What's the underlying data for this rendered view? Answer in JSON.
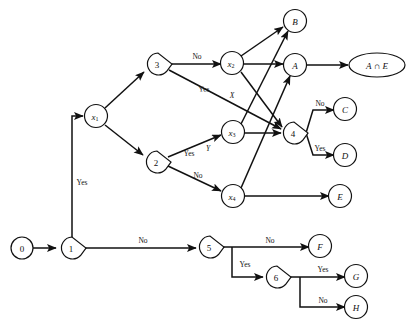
{
  "diagram": {
    "canvas": {
      "width": 411,
      "height": 326
    },
    "colors": {
      "stroke": "#111111",
      "fill": "#ffffff",
      "background": "#ffffff"
    },
    "nodes": [
      {
        "id": "n0",
        "label": "0",
        "shape": "circle",
        "x": 22,
        "y": 248
      },
      {
        "id": "n1",
        "label": "1",
        "shape": "teardrop",
        "x": 72,
        "y": 248
      },
      {
        "id": "nx1",
        "label": "x",
        "sub": "1",
        "shape": "circle",
        "x": 96,
        "y": 116,
        "italic": true
      },
      {
        "id": "n3",
        "label": "3",
        "shape": "teardrop",
        "x": 158,
        "y": 64
      },
      {
        "id": "n2",
        "label": "2",
        "shape": "teardrop",
        "x": 157,
        "y": 162
      },
      {
        "id": "nx2",
        "label": "x",
        "sub": "2",
        "shape": "circle",
        "x": 232,
        "y": 63,
        "italic": true
      },
      {
        "id": "nx3",
        "label": "x",
        "sub": "3",
        "shape": "circle",
        "x": 233,
        "y": 132,
        "italic": true
      },
      {
        "id": "nx4",
        "label": "x",
        "sub": "4",
        "shape": "circle",
        "x": 233,
        "y": 196,
        "italic": true
      },
      {
        "id": "nB",
        "label": "B",
        "shape": "circle",
        "x": 295,
        "y": 21,
        "italic": true
      },
      {
        "id": "nA",
        "label": "A",
        "shape": "circle",
        "x": 295,
        "y": 65,
        "italic": true
      },
      {
        "id": "n4",
        "label": "4",
        "shape": "teardrop",
        "x": 294,
        "y": 133
      },
      {
        "id": "nAE",
        "label": "A ∩ E",
        "shape": "ellipse",
        "x": 377,
        "y": 65,
        "italic": true
      },
      {
        "id": "nC",
        "label": "C",
        "shape": "circle",
        "x": 345,
        "y": 109,
        "italic": true
      },
      {
        "id": "nD",
        "label": "D",
        "shape": "circle",
        "x": 345,
        "y": 155,
        "italic": true
      },
      {
        "id": "nE",
        "label": "E",
        "shape": "circle",
        "x": 340,
        "y": 196,
        "italic": true
      },
      {
        "id": "n5",
        "label": "5",
        "shape": "teardrop",
        "x": 210,
        "y": 247
      },
      {
        "id": "n6",
        "label": "6",
        "shape": "teardrop",
        "x": 277,
        "y": 277
      },
      {
        "id": "nF",
        "label": "F",
        "shape": "circle",
        "x": 320,
        "y": 246,
        "italic": true
      },
      {
        "id": "nG",
        "label": "G",
        "shape": "circle",
        "x": 356,
        "y": 276,
        "italic": true
      },
      {
        "id": "nH",
        "label": "H",
        "shape": "circle",
        "x": 356,
        "y": 307,
        "italic": true
      }
    ],
    "edges": [
      {
        "id": "e0_1",
        "from": "n0",
        "to": "n1",
        "label": ""
      },
      {
        "id": "e1_x1",
        "from": "n1",
        "to": "nx1",
        "label": "Yes"
      },
      {
        "id": "e1_5",
        "from": "n1",
        "to": "n5",
        "label": "No"
      },
      {
        "id": "ex1_3",
        "from": "nx1",
        "to": "n3",
        "label": ""
      },
      {
        "id": "ex1_2",
        "from": "nx1",
        "to": "n2",
        "label": ""
      },
      {
        "id": "e3_x2",
        "from": "n3",
        "to": "nx2",
        "label": "No"
      },
      {
        "id": "e3_4",
        "from": "n3",
        "to": "n4",
        "label": "Yes",
        "label2": "X"
      },
      {
        "id": "e2_x3",
        "from": "n2",
        "to": "nx3",
        "label": "Yes",
        "label2": "Y"
      },
      {
        "id": "e2_x4",
        "from": "n2",
        "to": "nx4",
        "label": "No"
      },
      {
        "id": "ex2_B",
        "from": "nx2",
        "to": "nB",
        "label": ""
      },
      {
        "id": "ex2_A",
        "from": "nx2",
        "to": "nA",
        "label": ""
      },
      {
        "id": "ex2_4",
        "from": "nx2",
        "to": "n4",
        "label": ""
      },
      {
        "id": "ex3_B",
        "from": "nx3",
        "to": "nB",
        "label": ""
      },
      {
        "id": "ex3_4",
        "from": "nx3",
        "to": "n4",
        "label": ""
      },
      {
        "id": "ex4_A",
        "from": "nx4",
        "to": "nA",
        "label": ""
      },
      {
        "id": "ex4_E",
        "from": "nx4",
        "to": "nE",
        "label": ""
      },
      {
        "id": "eA_AE",
        "from": "nA",
        "to": "nAE",
        "label": ""
      },
      {
        "id": "e4_C",
        "from": "n4",
        "to": "nC",
        "label": "No"
      },
      {
        "id": "e4_D",
        "from": "n4",
        "to": "nD",
        "label": "Yes"
      },
      {
        "id": "e5_F",
        "from": "n5",
        "to": "nF",
        "label": "No"
      },
      {
        "id": "e5_6",
        "from": "n5",
        "to": "n6",
        "label": "Yes"
      },
      {
        "id": "e6_G",
        "from": "n6",
        "to": "nG",
        "label": "Yes"
      },
      {
        "id": "e6_H",
        "from": "n6",
        "to": "nH",
        "label": "No"
      }
    ],
    "edge_labels": {
      "yes_from_1": "Yes",
      "no_from_1": "No",
      "no_from_3": "No",
      "yes_from_3": "Yes",
      "x_from_3": "X",
      "yes_from_2": "Yes",
      "y_from_2": "Y",
      "no_from_2": "No",
      "no_from_4": "No",
      "yes_from_4": "Yes",
      "no_from_5": "No",
      "yes_from_5": "Yes",
      "yes_from_6": "Yes",
      "no_from_6": "No"
    }
  }
}
